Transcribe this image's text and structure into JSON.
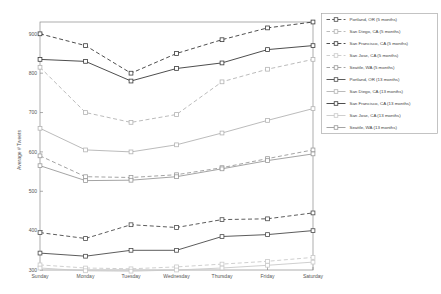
{
  "window": {
    "title": "Average Tweets by Day of Week"
  },
  "colors": {
    "background": "#ffffff",
    "axis": "#8a8a8a",
    "tick_text": "#555555",
    "legend_border": "#aaaaaa",
    "legend_text": "#444444"
  },
  "chart_data": {
    "type": "line",
    "title": "",
    "xlabel": "",
    "ylabel": "Average # Tweets",
    "grid": false,
    "legend_position": "outside upper right",
    "ylim": [
      300,
      930
    ],
    "yticks": [
      300,
      400,
      500,
      600,
      700,
      800,
      900
    ],
    "categories": [
      "Sunday",
      "Monday",
      "Tuesday",
      "Wednesday",
      "Thursday",
      "Friday",
      "Saturday"
    ],
    "marker": "square",
    "series": [
      {
        "name": "Portland, OR (5 months)",
        "style": "dashed",
        "color": "#4a4a4a",
        "values": [
          395,
          380,
          415,
          408,
          428,
          430,
          445
        ]
      },
      {
        "name": "San Diego, CA (5 months)",
        "style": "dashed",
        "color": "#b3b3b3",
        "values": [
          815,
          700,
          675,
          695,
          778,
          810,
          835
        ]
      },
      {
        "name": "San Francisco, CA (5 months)",
        "style": "dashed",
        "color": "#3a3a3a",
        "values": [
          900,
          870,
          800,
          850,
          885,
          915,
          930
        ]
      },
      {
        "name": "San Jose, CA (5 months)",
        "style": "dashed",
        "color": "#c9c9c9",
        "values": [
          313,
          305,
          303,
          308,
          315,
          322,
          332
        ]
      },
      {
        "name": "Seattle, WA (5 months)",
        "style": "dashed",
        "color": "#9a9a9a",
        "values": [
          590,
          537,
          535,
          542,
          560,
          583,
          605
        ]
      },
      {
        "name": "Portland, OR (13 months)",
        "style": "solid",
        "color": "#4a4a4a",
        "values": [
          343,
          335,
          350,
          350,
          385,
          390,
          400
        ]
      },
      {
        "name": "San Diego, CA (13 months)",
        "style": "solid",
        "color": "#b3b3b3",
        "values": [
          660,
          605,
          600,
          618,
          648,
          680,
          710
        ]
      },
      {
        "name": "San Francisco, CA (13 months)",
        "style": "solid",
        "color": "#3a3a3a",
        "values": [
          835,
          830,
          780,
          812,
          826,
          860,
          870
        ]
      },
      {
        "name": "San Jose, CA (13 months)",
        "style": "solid",
        "color": "#c9c9c9",
        "values": [
          305,
          298,
          297,
          300,
          305,
          312,
          320
        ]
      },
      {
        "name": "Seattle, WA (13 months)",
        "style": "solid",
        "color": "#9a9a9a",
        "values": [
          565,
          527,
          528,
          537,
          557,
          578,
          595
        ]
      }
    ]
  }
}
